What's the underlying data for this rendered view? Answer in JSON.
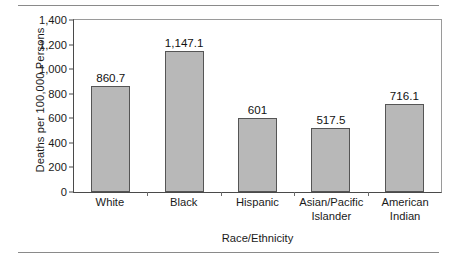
{
  "chart_data": {
    "type": "bar",
    "title": "",
    "xlabel": "Race/Ethnicity",
    "ylabel": "Deaths per 100,000 Persons",
    "categories": [
      "White",
      "Black",
      "Hispanic",
      "Asian/Pacific Islander",
      "American Indian"
    ],
    "values": [
      860.7,
      1147.1,
      601,
      517.5,
      716.1
    ],
    "value_labels": [
      "860.7",
      "1,147.1",
      "601",
      "517.5",
      "716.1"
    ],
    "category_lines": [
      [
        "White"
      ],
      [
        "Black"
      ],
      [
        "Hispanic"
      ],
      [
        "Asian/Pacific",
        "Islander"
      ],
      [
        "American",
        "Indian"
      ]
    ],
    "ylim": [
      0,
      1400
    ],
    "ytick_values": [
      0,
      200,
      400,
      600,
      800,
      1000,
      1200,
      1400
    ],
    "ytick_labels": [
      "0",
      "200",
      "400",
      "600",
      "800",
      "1,000",
      "1,200",
      "1,400"
    ],
    "grid": false,
    "legend": null,
    "bar_color": "#b8b8b8",
    "bar_border_color": "#555555",
    "axis_color": "#4a4a4a"
  }
}
